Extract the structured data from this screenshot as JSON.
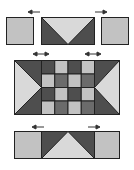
{
  "diagram": {
    "colors": {
      "light": "#c2c2c2",
      "lighter": "#d9d9d9",
      "dark": "#4e4e4e",
      "mid": "#6b6b6b",
      "outline": "#222222",
      "arrow": "#333333"
    },
    "rows": [
      {
        "name": "top-row",
        "units": [
          "square",
          "flying-geese-down",
          "square"
        ],
        "arrows": [
          "left",
          "right"
        ]
      },
      {
        "name": "center-row",
        "units": [
          "half-square-point-right",
          "four-patch-grid",
          "half-square-point-left"
        ],
        "arrows": [
          "both",
          "both"
        ],
        "grid": [
          [
            "dark",
            "light",
            "dark",
            "light"
          ],
          [
            "light",
            "dark",
            "light",
            "dark"
          ],
          [
            "dark",
            "light",
            "dark",
            "light"
          ],
          [
            "light",
            "dark",
            "light",
            "dark"
          ]
        ]
      },
      {
        "name": "bottom-row",
        "units": [
          "square",
          "flying-geese-up",
          "square"
        ],
        "arrows": [
          "left",
          "right"
        ]
      }
    ]
  }
}
